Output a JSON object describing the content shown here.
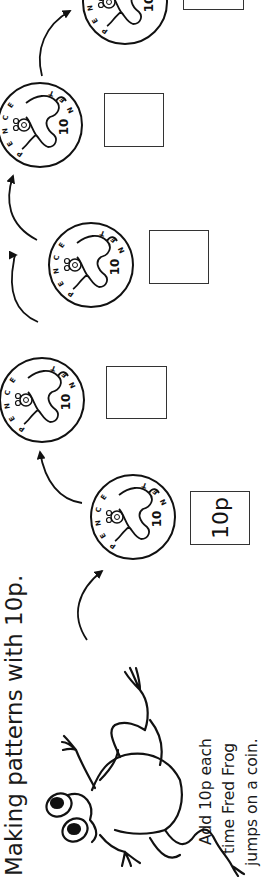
{
  "worksheet": {
    "title": "Making patterns with 10p.",
    "instructions": [
      "Add 10p each",
      "time Fred Frog",
      "jumps on a coin."
    ],
    "character": "Fred Frog",
    "coins": [
      {
        "label_top": "PENCE",
        "label_bottom": "TEN",
        "value": "10"
      },
      {
        "label_top": "PENCE",
        "label_bottom": "TEN",
        "value": "10"
      },
      {
        "label_top": "PENCE",
        "label_bottom": "TEN",
        "value": "10"
      },
      {
        "label_top": "PENCE",
        "label_bottom": "TEN",
        "value": "10"
      },
      {
        "label_top": "PENCE",
        "label_bottom": "TEN",
        "value": "10"
      }
    ],
    "answer_boxes": [
      {
        "value": "10p"
      },
      {
        "value": ""
      },
      {
        "value": ""
      },
      {
        "value": ""
      },
      {
        "value": ""
      }
    ],
    "orientation": "rotated 90° counter-clockwise"
  }
}
